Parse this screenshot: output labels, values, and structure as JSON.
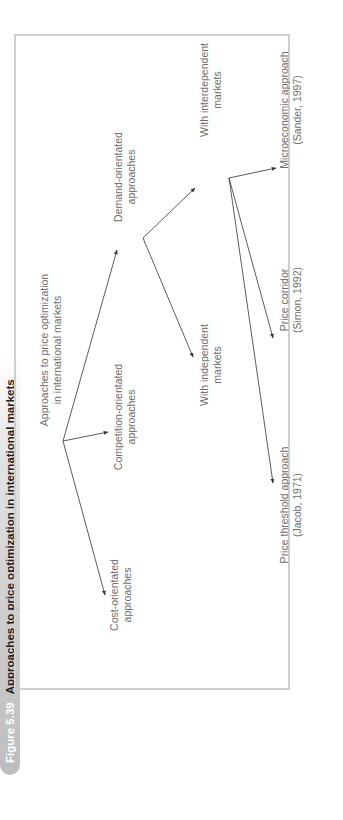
{
  "caption": {
    "figure_number": "Figure 5.39",
    "title": "Approaches to price optimization in international markets"
  },
  "nodes": {
    "root": {
      "line1": "Approaches to price optimization",
      "line2": "in international markets"
    },
    "cost": {
      "line1": "Cost-orientated",
      "line2": "approaches"
    },
    "competition": {
      "line1": "Competition-orientated",
      "line2": "approaches"
    },
    "demand": {
      "line1": "Demand-orientated",
      "line2": "approaches"
    },
    "independent": {
      "line1": "With independent",
      "line2": "markets"
    },
    "interdependent": {
      "line1": "With interdependent",
      "line2": "markets"
    },
    "threshold": {
      "line1": "Price threshold approach",
      "line2": "(Jacob, 1971)"
    },
    "corridor": {
      "line1": "Price corridor",
      "line2": "(Simon, 1992)"
    },
    "microeconomic": {
      "line1": "Microeconomic approach",
      "line2": "(Sander, 1997)"
    }
  },
  "edges": [
    {
      "from": "root",
      "to": "cost"
    },
    {
      "from": "root",
      "to": "competition"
    },
    {
      "from": "root",
      "to": "demand"
    },
    {
      "from": "demand",
      "to": "independent"
    },
    {
      "from": "demand",
      "to": "interdependent"
    },
    {
      "from": "interdependent",
      "to": "threshold"
    },
    {
      "from": "interdependent",
      "to": "corridor"
    },
    {
      "from": "interdependent",
      "to": "microeconomic"
    }
  ]
}
